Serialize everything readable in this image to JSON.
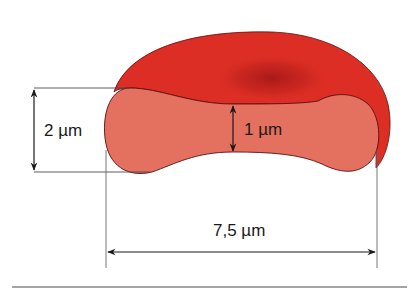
{
  "figure": {
    "labels": {
      "thickness_edge": "2 µm",
      "thickness_center": "1 µm",
      "diameter": "7,5 µm"
    },
    "colors": {
      "cell_top": "#dc2e24",
      "cell_top_shade": "#a81a1a",
      "cross_section": "#e4705f",
      "outline": "#5a1010",
      "dimension_line": "#1a1a1a",
      "extension_line": "#6a6a6a",
      "rule": "#4a4a4a"
    }
  }
}
